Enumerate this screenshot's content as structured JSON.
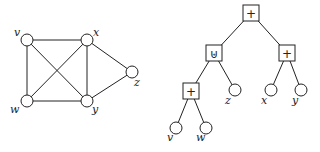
{
  "graph": {
    "nodes": [
      {
        "id": "v",
        "label": "v"
      },
      {
        "id": "x",
        "label": "x"
      },
      {
        "id": "z",
        "label": "z"
      },
      {
        "id": "w",
        "label": "w"
      },
      {
        "id": "y",
        "label": "y"
      }
    ],
    "edges": [
      [
        "v",
        "x"
      ],
      [
        "v",
        "w"
      ],
      [
        "v",
        "y"
      ],
      [
        "x",
        "w"
      ],
      [
        "x",
        "y"
      ],
      [
        "x",
        "z"
      ],
      [
        "w",
        "y"
      ],
      [
        "y",
        "z"
      ]
    ]
  },
  "tree": {
    "nodes": [
      {
        "id": "root",
        "type": "op",
        "label": "+"
      },
      {
        "id": "union",
        "type": "op",
        "label": "⊎"
      },
      {
        "id": "plus_right",
        "type": "op",
        "label": "+"
      },
      {
        "id": "plus_left",
        "type": "op",
        "label": "+"
      },
      {
        "id": "tz",
        "type": "leaf",
        "label": "z"
      },
      {
        "id": "tx",
        "type": "leaf",
        "label": "x"
      },
      {
        "id": "ty",
        "type": "leaf",
        "label": "y"
      },
      {
        "id": "tv",
        "type": "leaf",
        "label": "v"
      },
      {
        "id": "tw",
        "type": "leaf",
        "label": "w"
      }
    ],
    "edges": [
      [
        "root",
        "union"
      ],
      [
        "root",
        "plus_right"
      ],
      [
        "union",
        "plus_left"
      ],
      [
        "union",
        "tz"
      ],
      [
        "plus_right",
        "tx"
      ],
      [
        "plus_right",
        "ty"
      ],
      [
        "plus_left",
        "tv"
      ],
      [
        "plus_left",
        "tw"
      ]
    ]
  }
}
